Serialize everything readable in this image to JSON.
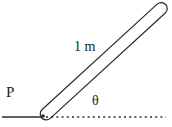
{
  "diagram": {
    "labels": {
      "length": "1 m",
      "point": "P",
      "angle": "θ"
    },
    "colors": {
      "stroke": "#2a2a2a",
      "background": "#ffffff"
    }
  }
}
